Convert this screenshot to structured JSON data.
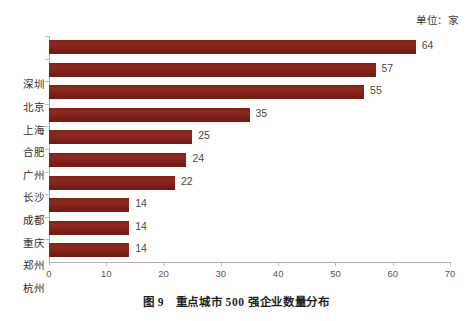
{
  "unit_note": "单位：家",
  "caption": "图 9　重点城市 500 强企业数量分布",
  "colors": {
    "bar": "#7d221a",
    "axis": "#b9b0ad",
    "tick_label": "#565656",
    "value_label": "#4a4a4a",
    "background": "#fffffe"
  },
  "chart_data": {
    "type": "bar",
    "orientation": "horizontal",
    "title": "图 9　重点城市 500 强企业数量分布",
    "subtitle": "",
    "xlabel": "",
    "ylabel": "",
    "unit": "单位：家",
    "categories": [
      "深圳",
      "北京",
      "上海",
      "合肥",
      "广州",
      "长沙",
      "成都",
      "重庆",
      "郑州",
      "杭州"
    ],
    "values": [
      64,
      57,
      55,
      35,
      25,
      24,
      22,
      14,
      14,
      14
    ],
    "value_labels": [
      "64",
      "57",
      "55",
      "35",
      "25",
      "24",
      "22",
      "14",
      "14",
      "14"
    ],
    "xlim": [
      0,
      70
    ],
    "xticks": [
      0,
      10,
      20,
      30,
      40,
      50,
      60,
      70
    ],
    "xtick_labels": [
      "0",
      "10",
      "20",
      "30",
      "40",
      "50",
      "60",
      "70"
    ],
    "grid": false,
    "legend": false,
    "series": [
      {
        "name": "500强企业数量",
        "values": [
          64,
          57,
          55,
          35,
          25,
          24,
          22,
          14,
          14,
          14
        ]
      }
    ]
  }
}
